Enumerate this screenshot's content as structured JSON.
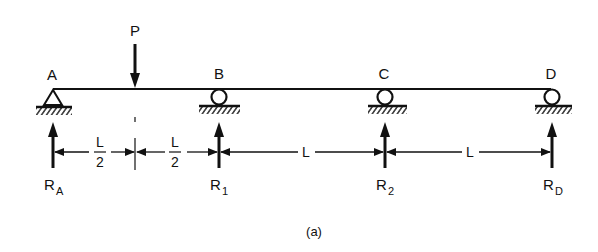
{
  "diagram": {
    "type": "continuous-beam",
    "caption": "(a)",
    "load": {
      "label": "P"
    },
    "points": [
      {
        "id": "A",
        "label": "A",
        "support": "pin"
      },
      {
        "id": "B",
        "label": "B",
        "support": "roller"
      },
      {
        "id": "C",
        "label": "C",
        "support": "roller"
      },
      {
        "id": "D",
        "label": "D",
        "support": "roller"
      }
    ],
    "reactions": [
      {
        "main": "R",
        "sub": "A"
      },
      {
        "main": "R",
        "sub": "1"
      },
      {
        "main": "R",
        "sub": "2"
      },
      {
        "main": "R",
        "sub": "D"
      }
    ],
    "dimensions": [
      {
        "num": "L",
        "den": "2"
      },
      {
        "num": "L",
        "den": "2"
      },
      {
        "text": "L"
      },
      {
        "text": "L"
      }
    ]
  }
}
